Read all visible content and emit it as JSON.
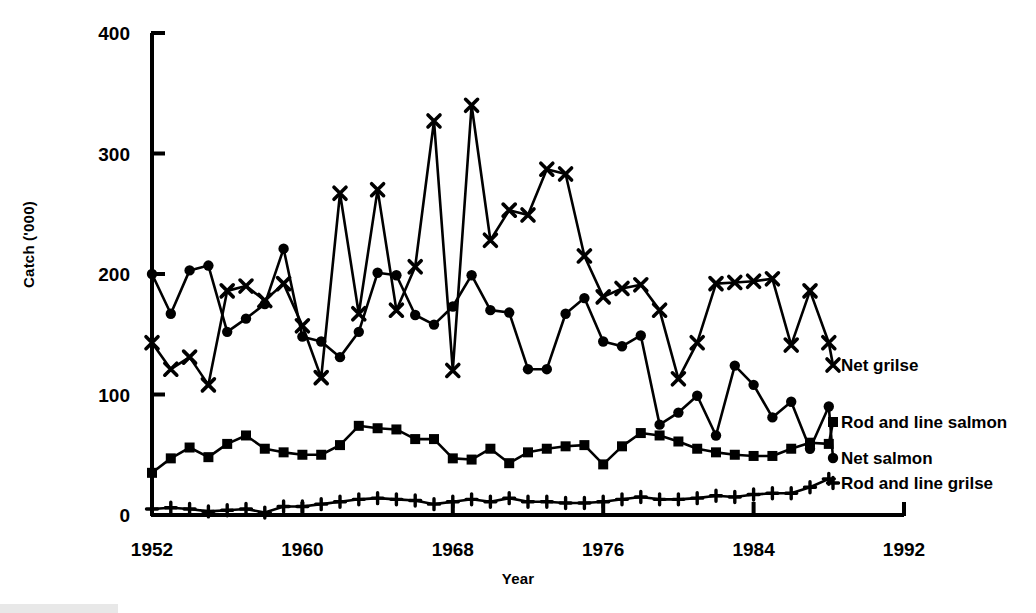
{
  "chart_data": {
    "type": "line",
    "title": "",
    "xlabel": "Year",
    "ylabel": "Catch ('000)",
    "xlim": [
      1952,
      1992
    ],
    "ylim": [
      0,
      400
    ],
    "yticks": [
      0,
      100,
      200,
      300,
      400
    ],
    "xticks": [
      1952,
      1960,
      1968,
      1976,
      1984,
      1992
    ],
    "grid": false,
    "legend_position": "right-inline",
    "x": [
      1952,
      1953,
      1954,
      1955,
      1956,
      1957,
      1958,
      1959,
      1960,
      1961,
      1962,
      1963,
      1964,
      1965,
      1966,
      1967,
      1968,
      1969,
      1970,
      1971,
      1972,
      1973,
      1974,
      1975,
      1976,
      1977,
      1978,
      1979,
      1980,
      1981,
      1982,
      1983,
      1984,
      1985,
      1986,
      1987,
      1988
    ],
    "series": [
      {
        "name": "Net grilse",
        "marker": "x",
        "values": [
          143,
          121,
          131,
          108,
          186,
          190,
          178,
          192,
          157,
          114,
          267,
          167,
          270,
          170,
          206,
          327,
          120,
          340,
          228,
          253,
          249,
          287,
          283,
          215,
          181,
          188,
          191,
          170,
          113,
          143,
          192,
          193,
          194,
          196,
          141,
          186,
          143
        ]
      },
      {
        "name": "Net salmon",
        "marker": "circle",
        "values": [
          200,
          167,
          203,
          207,
          152,
          163,
          175,
          221,
          148,
          144,
          131,
          152,
          201,
          199,
          166,
          158,
          173,
          199,
          170,
          168,
          121,
          121,
          167,
          180,
          144,
          140,
          149,
          75,
          85,
          99,
          66,
          124,
          108,
          81,
          94,
          55,
          90
        ]
      },
      {
        "name": "Rod and line salmon",
        "marker": "square",
        "values": [
          35,
          47,
          56,
          48,
          59,
          66,
          55,
          52,
          50,
          50,
          58,
          74,
          72,
          71,
          63,
          63,
          47,
          46,
          55,
          43,
          52,
          55,
          57,
          58,
          42,
          57,
          68,
          66,
          61,
          55,
          52,
          50,
          49,
          49,
          55,
          60,
          59
        ]
      },
      {
        "name": "Rod and line grilse",
        "marker": "plus",
        "values": [
          5,
          6,
          5,
          3,
          4,
          5,
          2,
          7,
          7,
          9,
          11,
          13,
          14,
          13,
          12,
          9,
          11,
          13,
          11,
          14,
          11,
          11,
          10,
          10,
          11,
          13,
          15,
          13,
          13,
          14,
          16,
          15,
          17,
          18,
          18,
          23,
          30
        ]
      }
    ]
  },
  "labels": {
    "net_grilse": "Net grilse",
    "rod_and_line_salmon": "Rod and line salmon",
    "net_salmon": "Net salmon",
    "rod_and_line_grilse": "Rod and line grilse",
    "y_axis_title": "Catch ('000)",
    "x_axis_title": "Year"
  },
  "colors": {
    "line": "#000000",
    "background": "#ffffff"
  }
}
